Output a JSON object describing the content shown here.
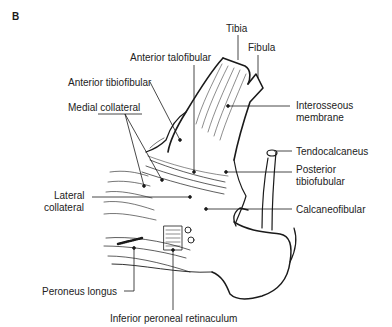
{
  "figure": {
    "panel_letter": "B",
    "stroke_color": "#1a1a1a",
    "background": "#ffffff"
  },
  "labels": {
    "tibia": "Tibia",
    "fibula": "Fibula",
    "anterior_talofibular": "Anterior talofibular",
    "anterior_tibiofibular": "Anterior tibiofibular",
    "medial_collateral": "Medial collateral",
    "interosseous_line1": "Interosseous",
    "interosseous_line2": "membrane",
    "tendocalcaneus": "Tendocalcaneus",
    "posterior_tibiofibular_line1": "Posterior",
    "posterior_tibiofibular_line2": "tibiofubular",
    "lateral_collateral_line1": "Lateral",
    "lateral_collateral_line2": "collateral",
    "calcaneofibular": "Calcaneofibular",
    "peroneus_longus": "Peroneus longus",
    "inferior_peroneal_retinaculum": "Inferior peroneal retinaculum"
  }
}
